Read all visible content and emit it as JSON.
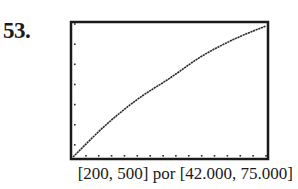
{
  "problem": {
    "number": "53."
  },
  "window": {
    "label": "[200, 500] por [42.000, 75.000]"
  },
  "colors": {
    "frame": "#1a1a1a",
    "curve": "#2a2a2a",
    "ticks": "#2a2a2a",
    "background": "#ffffff"
  },
  "chart_data": {
    "type": "line",
    "title": "",
    "xlabel": "",
    "ylabel": "",
    "xlim": [
      200,
      500
    ],
    "ylim": [
      42000,
      75000
    ],
    "xscl": 20,
    "yscl": 5000,
    "grid": false,
    "legend": null,
    "annotations": [
      "53.",
      "[200, 500] por [42.000, 75.000]"
    ],
    "series": [
      {
        "name": "curve",
        "x": [
          200,
          250,
          300,
          350,
          400,
          450,
          500
        ],
        "y": [
          42000,
          49800,
          56300,
          61500,
          67000,
          71200,
          74500
        ]
      }
    ]
  }
}
